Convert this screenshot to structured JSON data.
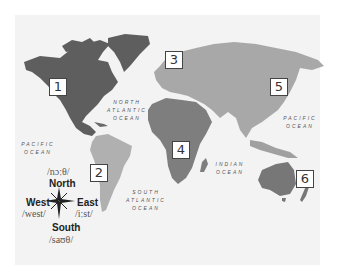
{
  "map": {
    "colors": {
      "north_america": "#5e5e5e",
      "south_america": "#b0b0b0",
      "europe_asia": "#a8a8a8",
      "africa": "#7e7e7e",
      "oceania": "#777777",
      "ocean_bg": "#f0f0f0",
      "box_border": "#444444"
    },
    "region_boxes": [
      {
        "label": "1",
        "region": "North America"
      },
      {
        "label": "2",
        "region": "South America"
      },
      {
        "label": "3",
        "region": "Europe"
      },
      {
        "label": "4",
        "region": "Africa"
      },
      {
        "label": "5",
        "region": "Asia"
      },
      {
        "label": "6",
        "region": "Oceania"
      }
    ],
    "oceans": {
      "north_atlantic": [
        "NORTH",
        "ATLANTIC",
        "OCEAN"
      ],
      "south_atlantic": [
        "SOUTH",
        "ATLANTIC",
        "OCEAN"
      ],
      "indian": [
        "INDIAN",
        "OCEAN"
      ],
      "pacific_west": [
        "PACIFIC",
        "OCEAN"
      ],
      "pacific_east": [
        "PACIFIC",
        "OCEAN"
      ]
    },
    "compass": {
      "north": {
        "word": "North",
        "phonetic": "/nɔːθ/"
      },
      "south": {
        "word": "South",
        "phonetic": "/saʊθ/"
      },
      "east": {
        "word": "East",
        "phonetic": "/iːst/"
      },
      "west": {
        "word": "West",
        "phonetic": "/west/"
      }
    }
  }
}
